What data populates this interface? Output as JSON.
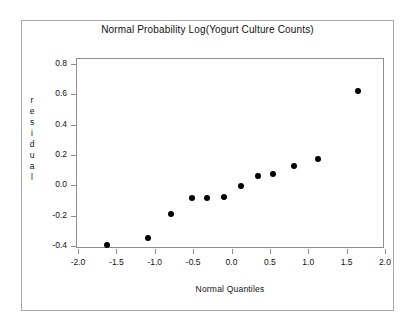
{
  "chart_data": {
    "type": "scatter",
    "title": "Normal Probability Log(Yogurt Culture Counts)",
    "xlabel": "Normal Quantiles",
    "ylabel": "residual",
    "ylabel_letters": [
      "r",
      "e",
      "s",
      "i",
      "d",
      "u",
      "a",
      "l"
    ],
    "xlim": [
      -2.0,
      2.0
    ],
    "ylim": [
      -0.45,
      0.85
    ],
    "grid": false,
    "legend": null,
    "marker": "filled-circle",
    "marker_color": "#000000",
    "xticks": [
      "-2.0",
      "-1.5",
      "-1.0",
      "-0.5",
      "0.0",
      "0.5",
      "1.0",
      "1.5",
      "2.0"
    ],
    "xtick_values": [
      -2.0,
      -1.5,
      -1.0,
      -0.5,
      0.0,
      0.5,
      1.0,
      1.5,
      2.0
    ],
    "yticks": [
      "0.8",
      "0.6",
      "0.4",
      "0.2",
      "0.0",
      "-0.2",
      "-0.4"
    ],
    "ytick_values": [
      0.8,
      0.6,
      0.4,
      0.2,
      0.0,
      -0.2,
      -0.4
    ],
    "x": [
      -1.64,
      -1.1,
      -0.8,
      -0.53,
      -0.33,
      -0.11,
      0.11,
      0.33,
      0.53,
      0.8,
      1.11,
      1.64
    ],
    "y": [
      -0.39,
      -0.34,
      -0.185,
      -0.08,
      -0.08,
      -0.07,
      0.0,
      0.065,
      0.08,
      0.135,
      0.18,
      0.63
    ],
    "points": [
      {
        "x": -1.64,
        "y": -0.39
      },
      {
        "x": -1.1,
        "y": -0.34
      },
      {
        "x": -0.8,
        "y": -0.185
      },
      {
        "x": -0.53,
        "y": -0.08
      },
      {
        "x": -0.33,
        "y": -0.08
      },
      {
        "x": -0.11,
        "y": -0.07
      },
      {
        "x": 0.11,
        "y": 0.0
      },
      {
        "x": 0.33,
        "y": 0.065
      },
      {
        "x": 0.53,
        "y": 0.08
      },
      {
        "x": 0.8,
        "y": 0.135
      },
      {
        "x": 1.11,
        "y": 0.18
      },
      {
        "x": 1.64,
        "y": 0.63
      }
    ],
    "n_points": 12
  },
  "colors": {
    "background": "#ffffff",
    "outer_frame": "#a8a8a8",
    "panel_frame": "#8e8e8e",
    "text": "#111111",
    "marker": "#000000"
  }
}
